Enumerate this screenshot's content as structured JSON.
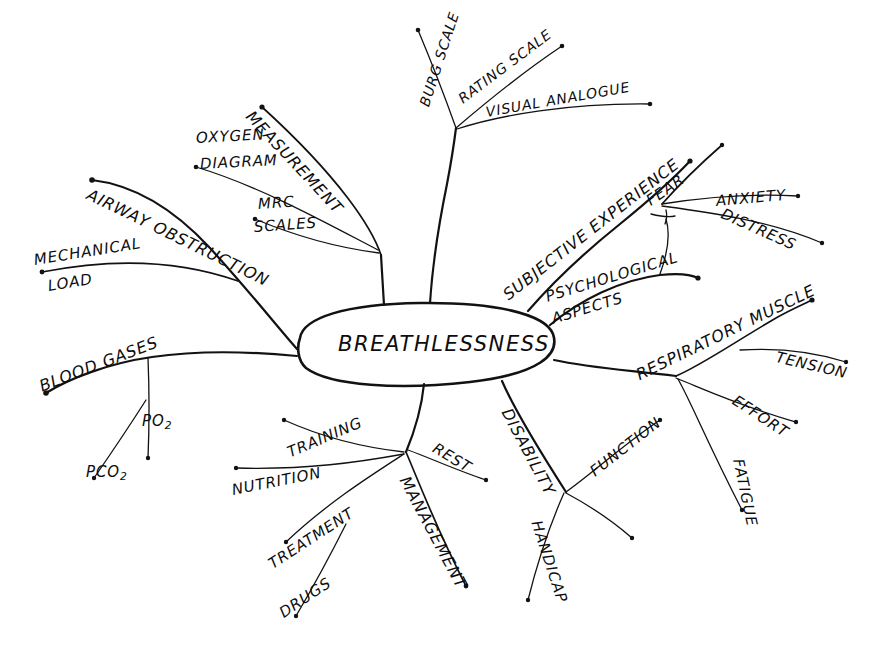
{
  "diagram": {
    "type": "mind-map",
    "title": "Breathlessness",
    "style": "hand-drawn sketch, black ink on white paper",
    "background_color": "#ffffff",
    "ink_color": "#121212",
    "center": {
      "label": "BREATHLESSNESS",
      "shape": "ellipse",
      "cx": 425,
      "cy": 345,
      "rx": 130,
      "ry": 40
    },
    "branches": [
      {
        "id": "measurement",
        "label": "MEASUREMENT",
        "children": [
          {
            "id": "oxygen-diagram",
            "label": "OXYGEN DIAGRAM"
          },
          {
            "id": "mrc-scales",
            "label": "MRC SCALES"
          }
        ]
      },
      {
        "id": "airway-obstruction",
        "label": "AIRWAY OBSTRUCTION",
        "children": [
          {
            "id": "mechanical-load",
            "label": "MECHANICAL LOAD"
          }
        ]
      },
      {
        "id": "blood-gases",
        "label": "BLOOD GASES",
        "children": [
          {
            "id": "po2",
            "label": "PO2",
            "display": "PO₂"
          },
          {
            "id": "pco2",
            "label": "PCO2",
            "display": "PCO₂"
          }
        ]
      },
      {
        "id": "rating-scale",
        "label": "RATING SCALE",
        "children": [
          {
            "id": "burg-scale",
            "label": "BURG SCALE"
          },
          {
            "id": "visual-analogue",
            "label": "VISUAL ANALOGUE"
          }
        ]
      },
      {
        "id": "subjective-experience",
        "label": "SUBJECTIVE EXPERIENCE",
        "children": [
          {
            "id": "fear",
            "label": "FEAR"
          },
          {
            "id": "anxiety",
            "label": "ANXIETY"
          },
          {
            "id": "distress",
            "label": "DISTRESS"
          }
        ]
      },
      {
        "id": "psychological-aspects",
        "label": "PSYCHOLOGICAL ASPECTS",
        "children": []
      },
      {
        "id": "respiratory-muscle",
        "label": "RESPIRATORY MUSCLE",
        "children": [
          {
            "id": "tension",
            "label": "TENSION"
          },
          {
            "id": "effort",
            "label": "EFFORT"
          },
          {
            "id": "fatigue",
            "label": "FATIGUE"
          }
        ]
      },
      {
        "id": "disability",
        "label": "DISABILITY",
        "children": [
          {
            "id": "function",
            "label": "FUNCTION"
          },
          {
            "id": "handicap",
            "label": "HANDICAP"
          }
        ]
      },
      {
        "id": "management",
        "label": "MANAGEMENT",
        "children": [
          {
            "id": "rest",
            "label": "REST"
          },
          {
            "id": "training",
            "label": "TRAINING"
          },
          {
            "id": "nutrition",
            "label": "NUTRITION"
          },
          {
            "id": "treatment",
            "label": "TREATMENT"
          },
          {
            "id": "drugs",
            "label": "DRUGS"
          }
        ]
      }
    ]
  },
  "labels": {
    "center": "BREATHLESSNESS",
    "measurement": "MEASUREMENT",
    "oxygen": "OXYGEN",
    "diagram": "DIAGRAM",
    "mrc": "MRC",
    "scales": "SCALES",
    "airway_obstruction": "AIRWAY OBSTRUCTION",
    "mechanical": "MECHANICAL",
    "load": "LOAD",
    "blood_gases": "BLOOD GASES",
    "po2_main": "PO",
    "po2_sub": "2",
    "pco2_main": "PCO",
    "pco2_sub": "2",
    "burg_scale": "BURG SCALE",
    "rating_scale": "RATING SCALE",
    "visual_analogue": "VISUAL ANALOGUE",
    "subjective_experience": "SUBJECTIVE EXPERIENCE",
    "fear": "FEAR",
    "anxiety": "ANXIETY",
    "distress": "DISTRESS",
    "psychological": "PSYCHOLOGICAL",
    "aspects": "ASPECTS",
    "respiratory_muscle": "RESPIRATORY MUSCLE",
    "tension": "TENSION",
    "effort": "EFFORT",
    "fatigue": "FATIGUE",
    "disability": "DISABILITY",
    "function": "FUNCTION",
    "handicap": "HANDICAP",
    "management": "MANAGEMENT",
    "rest": "REST",
    "training": "TRAINING",
    "nutrition": "NUTRITION",
    "treatment": "TREATMENT",
    "drugs": "DRUGS"
  }
}
